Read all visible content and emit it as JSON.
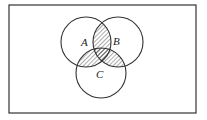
{
  "diagram": {
    "type": "venn",
    "universe": {
      "x": 9,
      "y": 5,
      "width": 187,
      "height": 108,
      "stroke": "#333333"
    },
    "sets": [
      {
        "name": "A",
        "cx": 86,
        "cy": 42,
        "r": 25,
        "label_x": 84,
        "label_y": 46
      },
      {
        "name": "B",
        "cx": 118,
        "cy": 42,
        "r": 25,
        "label_x": 114,
        "label_y": 45
      },
      {
        "name": "C",
        "cx": 101,
        "cy": 73,
        "r": 25,
        "label_x": 97,
        "label_y": 78
      }
    ],
    "shaded_regions": [
      "A∩B",
      "A∩C",
      "B∩C"
    ],
    "shading": "diagonal-hatch",
    "stroke_color": "#333333"
  },
  "labels": {
    "a": "A",
    "b": "B",
    "c": "C"
  }
}
